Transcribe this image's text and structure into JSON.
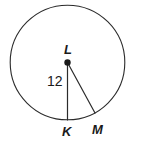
{
  "figure": {
    "kind": "circle-with-two-radii",
    "background_color": "#ffffff",
    "stroke_color": "#2b2b2b",
    "text_color": "#1a1a1a",
    "circle": {
      "center_x": 67.5,
      "center_y": 62.5,
      "radius": 57.5
    },
    "center_point": {
      "label": "L",
      "x": 67.5,
      "y": 62.5,
      "dot_radius": 3.2
    },
    "points": [
      {
        "name": "point-k",
        "label": "K",
        "x": 67.5,
        "y": 120.0
      },
      {
        "name": "point-m",
        "label": "M",
        "x": 95.0,
        "y": 113.0
      }
    ],
    "segments": [
      {
        "name": "radius-lk",
        "from": "L",
        "to": "K",
        "measure_label": "12"
      },
      {
        "name": "radius-lm",
        "from": "L",
        "to": "M",
        "measure_label": ""
      }
    ],
    "labels": {
      "center": "L",
      "k": "K",
      "m": "M",
      "radius_measure": "12"
    }
  }
}
